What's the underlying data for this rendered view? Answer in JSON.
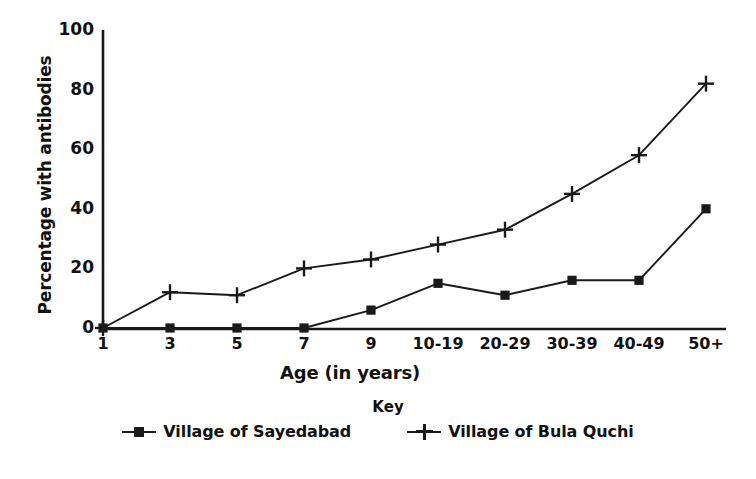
{
  "chart_data": {
    "type": "line",
    "title": "",
    "xlabel": "Age (in years)",
    "ylabel": "Percentage with antibodies",
    "categories": [
      "1",
      "3",
      "5",
      "7",
      "9",
      "10-19",
      "20-29",
      "30-39",
      "40-49",
      "50+"
    ],
    "ylim": [
      0,
      100
    ],
    "yticks": [
      0,
      20,
      40,
      60,
      80,
      100
    ],
    "ytick_labels": [
      "0",
      "20",
      "40",
      "60",
      "80",
      "100"
    ],
    "grid": false,
    "legend_position": "bottom",
    "legend_title": "Key",
    "series": [
      {
        "name": "Village of Sayedabad",
        "marker": "square",
        "color": "#1a1a1a",
        "values": [
          0,
          0,
          0,
          0,
          6,
          15,
          11,
          16,
          16,
          40
        ]
      },
      {
        "name": "Village of Bula Quchi",
        "marker": "plus",
        "color": "#1a1a1a",
        "values": [
          0,
          12,
          11,
          20,
          23,
          28,
          33,
          45,
          58,
          82
        ]
      }
    ]
  },
  "axes": {
    "y_title": "Percentage with antibodies",
    "x_title": "Age (in years)"
  },
  "legend": {
    "title": "Key",
    "entries": [
      {
        "label": "Village of Sayedabad",
        "marker": "square-marker"
      },
      {
        "label": "Village of Bula Quchi",
        "marker": "plus-marker"
      }
    ]
  }
}
